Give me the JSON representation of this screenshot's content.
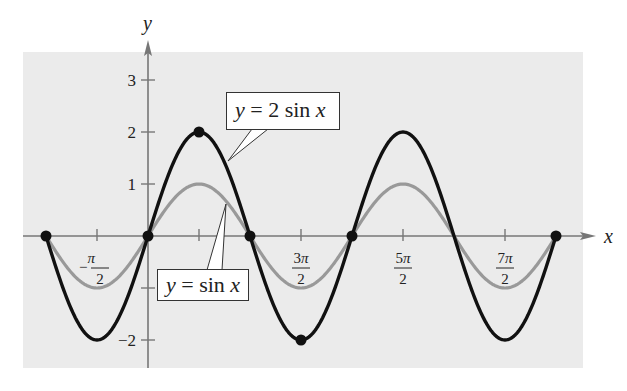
{
  "chart_data": {
    "type": "line",
    "title": "",
    "xlabel": "x",
    "ylabel": "y",
    "xlim": [
      -3.14159,
      12.566
    ],
    "ylim": [
      -2.5,
      3.5
    ],
    "grid": false,
    "background": "#ebebeb",
    "x_ticks": [
      {
        "value": -1.5708,
        "num": "−π",
        "den": "2",
        "label": "-π/2"
      },
      {
        "value": 1.5708,
        "num": "",
        "den": "",
        "label": ""
      },
      {
        "value": 4.7124,
        "num": "3π",
        "den": "2",
        "label": "3π/2"
      },
      {
        "value": 7.854,
        "num": "5π",
        "den": "2",
        "label": "5π/2"
      },
      {
        "value": 10.9956,
        "num": "7π",
        "den": "2",
        "label": "7π/2"
      }
    ],
    "y_ticks": [
      {
        "value": 3,
        "label": "3"
      },
      {
        "value": 2,
        "label": "2"
      },
      {
        "value": 1,
        "label": "1"
      },
      {
        "value": -1,
        "label": ""
      },
      {
        "value": -2,
        "label": "−2"
      }
    ],
    "series": [
      {
        "name": "y = 2 sin x",
        "color": "#111111",
        "amplitude": 2,
        "x_range": [
          -3.14159,
          12.566
        ],
        "key_points": [
          [
            -3.14159,
            0
          ],
          [
            -1.5708,
            -2
          ],
          [
            0,
            0
          ],
          [
            1.5708,
            2
          ],
          [
            3.14159,
            0
          ],
          [
            4.7124,
            -2
          ],
          [
            6.2832,
            0
          ],
          [
            7.854,
            2
          ],
          [
            9.4248,
            0
          ],
          [
            10.9956,
            -2
          ],
          [
            12.566,
            0
          ]
        ]
      },
      {
        "name": "y = sin x",
        "color": "#999999",
        "amplitude": 1,
        "x_range": [
          -3.14159,
          12.566
        ],
        "key_points": [
          [
            -3.14159,
            0
          ],
          [
            -1.5708,
            -1
          ],
          [
            0,
            0
          ],
          [
            1.5708,
            1
          ],
          [
            3.14159,
            0
          ],
          [
            4.7124,
            -1
          ],
          [
            6.2832,
            0
          ],
          [
            7.854,
            1
          ],
          [
            9.4248,
            0
          ],
          [
            10.9956,
            -1
          ],
          [
            12.566,
            0
          ]
        ]
      }
    ],
    "marked_points": [
      [
        -3.14159,
        0
      ],
      [
        0,
        0
      ],
      [
        1.5708,
        2
      ],
      [
        3.14159,
        0
      ],
      [
        4.7124,
        -2
      ],
      [
        6.2832,
        0
      ],
      [
        12.566,
        0
      ]
    ],
    "annotations": [
      {
        "text_var": "y",
        "text_eq": " = 2 sin ",
        "text_arg": "x",
        "label": "y = 2 sin x",
        "series": "y = 2 sin x"
      },
      {
        "text_var": "y",
        "text_eq": " = sin ",
        "text_arg": "x",
        "label": "y = sin x",
        "series": "y = sin x"
      }
    ]
  },
  "axes": {
    "x_label": "x",
    "y_label": "y"
  },
  "labels": {
    "callout_2sin": {
      "var": "y",
      "eq": " = 2 sin ",
      "arg": "x"
    },
    "callout_sin": {
      "var": "y",
      "eq": " = sin ",
      "arg": "x"
    }
  }
}
